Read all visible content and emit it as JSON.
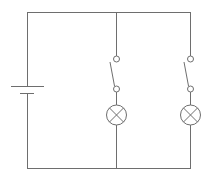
{
  "diagram": {
    "type": "circuit",
    "colors": {
      "line": "#6e6e6e",
      "background": "#ffffff"
    },
    "components": [
      {
        "id": "battery",
        "kind": "cell",
        "label": ""
      },
      {
        "id": "switch-1",
        "kind": "switch",
        "state": "open",
        "label": ""
      },
      {
        "id": "lamp-1",
        "kind": "lamp",
        "label": ""
      },
      {
        "id": "switch-2",
        "kind": "switch",
        "state": "open",
        "label": ""
      },
      {
        "id": "lamp-2",
        "kind": "lamp",
        "label": ""
      }
    ],
    "topology": "parallel"
  }
}
